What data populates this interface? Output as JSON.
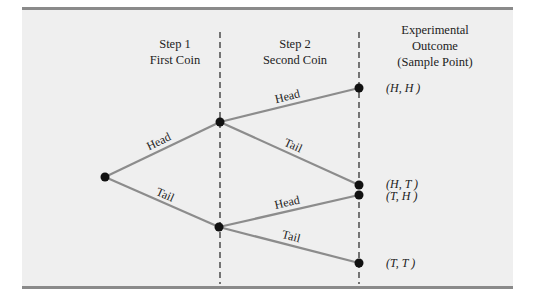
{
  "headers": {
    "step1": {
      "line1": "Step 1",
      "line2": "First Coin"
    },
    "step2": {
      "line1": "Step 2",
      "line2": "Second Coin"
    },
    "outcome": {
      "line1": "Experimental",
      "line2": "Outcome",
      "line3": "(Sample Point)"
    }
  },
  "tree": {
    "step1_branches": [
      {
        "label": "Head"
      },
      {
        "label": "Tail"
      }
    ],
    "step2_branches": [
      {
        "from": "Head",
        "label": "Head",
        "outcome": "(H, H )"
      },
      {
        "from": "Head",
        "label": "Tail",
        "outcome": "(H, T )"
      },
      {
        "from": "Tail",
        "label": "Head",
        "outcome": "(T, H )"
      },
      {
        "from": "Tail",
        "label": "Tail",
        "outcome": "(T, T )"
      }
    ]
  },
  "colors": {
    "branch_line": "#8c8c8c",
    "node": "#111111",
    "divider": "#222222",
    "panel": "#efefef",
    "rule": "#8a8a8a"
  }
}
